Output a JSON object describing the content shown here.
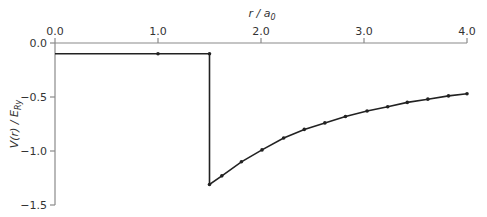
{
  "chart_data": {
    "type": "line",
    "title": "",
    "xlabel": "r / a0",
    "ylabel": "V(r) / E_Ry",
    "xlim": [
      0.0,
      4.0
    ],
    "ylim": [
      -1.5,
      0.0
    ],
    "x_axis_position": "top",
    "grid": false,
    "legend": null,
    "x_ticks": [
      "0.0",
      "1.0",
      "2.0",
      "3.0",
      "4.0"
    ],
    "y_ticks": [
      "0.0",
      "-0.5",
      "-1.0",
      "-1.5"
    ],
    "series": [
      {
        "name": "V(r)",
        "x": [
          0.0,
          1.0,
          1.5,
          1.5,
          1.62,
          1.81,
          2.01,
          2.22,
          2.42,
          2.62,
          2.82,
          3.03,
          3.23,
          3.42,
          3.62,
          3.82,
          4.0
        ],
        "y": [
          -0.1,
          -0.1,
          -0.1,
          -1.31,
          -1.23,
          -1.1,
          -0.99,
          -0.88,
          -0.8,
          -0.74,
          -0.68,
          -0.63,
          -0.59,
          -0.55,
          -0.52,
          -0.49,
          -0.47
        ]
      }
    ]
  },
  "labels": {
    "x_axis_title_main": "r / a",
    "x_axis_title_sub": "0",
    "y_axis_title_main": "V(r) / E",
    "y_axis_title_sub": "Ry"
  }
}
